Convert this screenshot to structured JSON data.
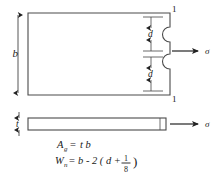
{
  "figure": {
    "background_color": "#ffffff",
    "line_color": "#3a3a3a",
    "text_color": "#1a1a1a"
  },
  "top_view": {
    "name": "plan-view-of-notched-plate",
    "width_dimension_label": "b",
    "notch_dimension_label_upper": "d",
    "notch_dimension_label_lower": "d",
    "section_label_top": "1",
    "section_label_bottom": "1",
    "stress_label": "σ",
    "notch_count": 2
  },
  "side_view": {
    "name": "edge-view-of-plate",
    "thickness_label": "t",
    "stress_label": "σ"
  },
  "equations": [
    {
      "id": "gross-area",
      "lhs_symbol": "A",
      "lhs_subscript": "g",
      "equals": "=",
      "rhs": "t b"
    },
    {
      "id": "net-width",
      "lhs_symbol": "W",
      "lhs_subscript": "n",
      "equals": "=",
      "rhs_prefix": "b - 2 ( d +",
      "fraction_numerator": "1",
      "fraction_denominator": "8",
      "rhs_suffix": ")"
    }
  ]
}
